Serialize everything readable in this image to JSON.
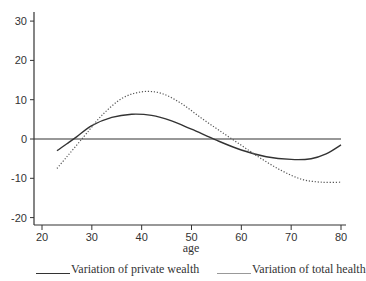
{
  "chart_data": {
    "type": "line",
    "title": "",
    "xlabel": "age",
    "ylabel": "",
    "xlim": [
      19,
      81
    ],
    "ylim": [
      -22,
      32
    ],
    "grid": false,
    "xticks": [
      20,
      30,
      40,
      50,
      60,
      70,
      80
    ],
    "yticks": [
      30,
      20,
      10,
      0,
      -10,
      -20
    ],
    "zero_line": true,
    "legend_position": "bottom",
    "series": [
      {
        "name": "Variation of private wealth",
        "style": "solid",
        "color": "#333333",
        "x": [
          23,
          25,
          27,
          30,
          34,
          38,
          42,
          46,
          50,
          55,
          60,
          65,
          70,
          74,
          77,
          80
        ],
        "y": [
          -3,
          -1.2,
          0.6,
          3.4,
          5.5,
          6.3,
          6.0,
          4.6,
          2.5,
          -0.3,
          -2.8,
          -4.5,
          -5.2,
          -5.0,
          -3.8,
          -1.5
        ]
      },
      {
        "name": "Variation of total health",
        "style": "dotted",
        "color": "#555555",
        "x": [
          23,
          25,
          27,
          29,
          32,
          36,
          40,
          44,
          48,
          52,
          56,
          60,
          64,
          68,
          72,
          76,
          80
        ],
        "y": [
          -7.5,
          -4.5,
          -1.5,
          1.5,
          6.0,
          10.3,
          12.0,
          11.6,
          9.0,
          5.3,
          1.8,
          -1.6,
          -5.0,
          -8.0,
          -10.2,
          -11.0,
          -11.0
        ]
      }
    ]
  },
  "legend": {
    "items": [
      {
        "label": "Variation of private wealth",
        "style": "solid"
      },
      {
        "label": "Variation of total health",
        "style": "dotted"
      }
    ]
  },
  "axes": {
    "x_title": "age",
    "x_tick_labels": [
      "20",
      "30",
      "40",
      "50",
      "60",
      "70",
      "80"
    ],
    "y_tick_labels": [
      "30",
      "20",
      "10",
      "0",
      "-10",
      "-20"
    ]
  }
}
